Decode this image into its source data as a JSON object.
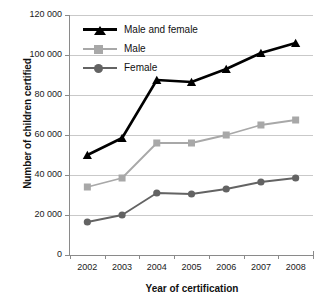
{
  "chart_data": {
    "type": "line",
    "title": "",
    "xlabel": "Year of certification",
    "ylabel": "Number of children certified",
    "categories": [
      "2002",
      "2003",
      "2004",
      "2005",
      "2006",
      "2007",
      "2008"
    ],
    "ytick_labels": [
      "0",
      "20 000",
      "40 000",
      "60 000",
      "80 000",
      "100 000",
      "120 000"
    ],
    "ytick_values": [
      0,
      20000,
      40000,
      60000,
      80000,
      100000,
      120000
    ],
    "ylim": [
      0,
      120000
    ],
    "grid": "horizontal",
    "legend_position": "top-left inside plot",
    "series": [
      {
        "name": "Male and female",
        "color": "#000000",
        "marker": "triangle",
        "values": [
          50000,
          58500,
          87500,
          86500,
          93000,
          101000,
          106000
        ]
      },
      {
        "name": "Male",
        "color": "#a8a8a8",
        "marker": "square",
        "values": [
          34000,
          38500,
          56000,
          56000,
          60000,
          65000,
          67500
        ]
      },
      {
        "name": "Female",
        "color": "#636363",
        "marker": "circle",
        "values": [
          16500,
          20000,
          31000,
          30500,
          33000,
          36500,
          38500
        ]
      }
    ]
  },
  "legend": {
    "items": [
      {
        "label": "Male and female"
      },
      {
        "label": "Male"
      },
      {
        "label": "Female"
      }
    ]
  },
  "axes": {
    "y_title": "Number of children certified",
    "x_title": "Year of certification"
  }
}
